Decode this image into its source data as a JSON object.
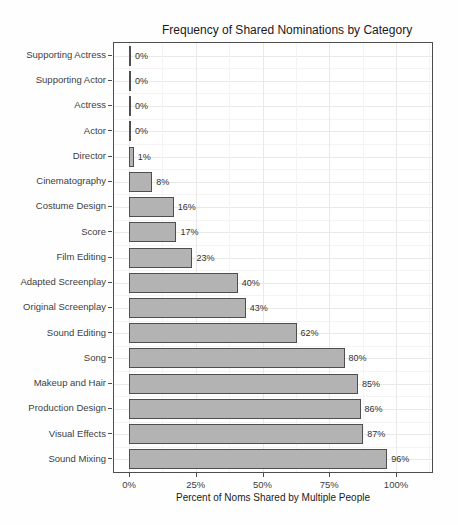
{
  "chart_data": {
    "type": "bar",
    "orientation": "horizontal",
    "title": "Frequency of Shared Nominations by Category",
    "xlabel": "Percent of Noms Shared by Multiple People",
    "ylabel": "",
    "categories": [
      "Supporting Actress",
      "Supporting Actor",
      "Actress",
      "Actor",
      "Director",
      "Cinematography",
      "Costume Design",
      "Score",
      "Film Editing",
      "Adapted Screenplay",
      "Original Screenplay",
      "Sound Editing",
      "Song",
      "Makeup and Hair",
      "Production Design",
      "Visual Effects",
      "Sound Mixing"
    ],
    "values": [
      0,
      0,
      0,
      0,
      1,
      8,
      16,
      17,
      23,
      40,
      43,
      62,
      80,
      85,
      86,
      87,
      96
    ],
    "bar_labels": [
      "0%",
      "0%",
      "0%",
      "0%",
      "1%",
      "8%",
      "16%",
      "17%",
      "23%",
      "40%",
      "43%",
      "62%",
      "80%",
      "85%",
      "86%",
      "87%",
      "96%"
    ],
    "x_ticks": [
      {
        "value": 0,
        "label": "0%"
      },
      {
        "value": 25,
        "label": "25%"
      },
      {
        "value": 50,
        "label": "50%"
      },
      {
        "value": 75,
        "label": "75%"
      },
      {
        "value": 100,
        "label": "100%"
      }
    ],
    "x_minor_ticks": [
      12.5,
      37.5,
      62.5,
      87.5,
      112.5
    ],
    "xlim": [
      -5.6,
      114
    ],
    "grid": true,
    "legend": "none",
    "colors": {
      "bar_fill": "#b3b3b3",
      "bar_border": "#4f4f4f",
      "panel_border": "#4d4d4d",
      "grid_major": "#e9e9e9",
      "grid_minor": "#f4f4f4",
      "axis_text": "#404040",
      "title_text": "#1a1a1a"
    }
  }
}
